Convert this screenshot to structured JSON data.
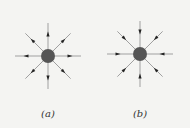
{
  "figures": [
    {
      "id": "a",
      "caption": "(a)",
      "cx": 48,
      "cy": 56,
      "direction": "outward",
      "charge_color": "#555555"
    },
    {
      "id": "b",
      "caption": "(b)",
      "cx": 140,
      "cy": 54,
      "direction": "inward",
      "charge_color": "#555555"
    }
  ],
  "line_color": "#a0a0a0",
  "arrow_color": "#222222"
}
